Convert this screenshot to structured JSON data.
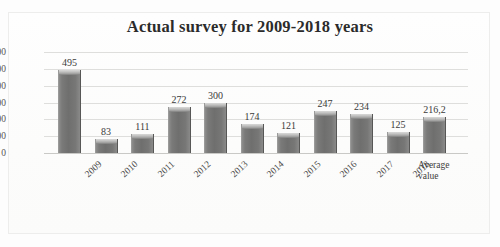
{
  "chart_data": {
    "type": "bar",
    "title": "Actual survey for 2009-2018 years",
    "xlabel": "",
    "ylabel": "",
    "categories": [
      "2009",
      "2010",
      "2011",
      "2012",
      "2013",
      "2014",
      "2015",
      "2016",
      "2017",
      "2018",
      "Average value"
    ],
    "values": [
      495,
      83,
      111,
      272,
      300,
      174,
      121,
      247,
      234,
      125,
      216.2
    ],
    "value_labels": [
      "495",
      "83",
      "111",
      "272",
      "300",
      "174",
      "121",
      "247",
      "234",
      "125",
      "216,2"
    ],
    "ylim": [
      0,
      600
    ],
    "yticks": [
      600,
      500,
      400,
      300,
      200,
      100,
      0
    ],
    "ytick_labels": [
      "600",
      "500",
      "400",
      "300",
      "200",
      "100",
      "0"
    ],
    "grid": true,
    "legend": false,
    "bar_color": "#777776",
    "bar_top_color": "#c9c9c8",
    "gridline_color": "#dededc",
    "title_color": "#2b2b2b",
    "background_color": "#fdfdfd",
    "last_category_label_lines": [
      "Average",
      "value"
    ]
  }
}
